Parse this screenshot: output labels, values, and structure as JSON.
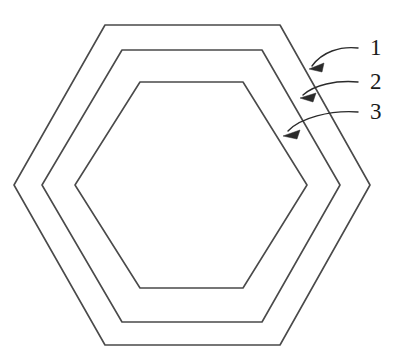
{
  "figure": {
    "background_color": "#ffffff",
    "line_color": "#4a4a4a",
    "leader_color": "#2b2b2b",
    "label_color": "#1a1a1a",
    "width": 407,
    "height": 363,
    "center": {
      "x": 192,
      "y": 185
    }
  },
  "shapes": [
    {
      "name": "outer-hexagon",
      "reference": "1",
      "points": "14,185 105,25 280,25 370,185 280,345 105,345",
      "top_y": 25,
      "bottom_y": 345,
      "left_x": 14,
      "right_x": 370
    },
    {
      "name": "middle-hexagon",
      "reference": "2",
      "points": "42,185 122,50 262,50 340,185 262,322 122,322",
      "top_y": 50,
      "bottom_y": 322,
      "left_x": 42,
      "right_x": 340
    },
    {
      "name": "inner-hexagon",
      "reference": "3",
      "points": "75,185 140,82 243,82 307,185 243,288 140,288",
      "top_y": 82,
      "bottom_y": 288,
      "left_x": 75,
      "right_x": 307
    }
  ],
  "callouts": [
    {
      "label": "1",
      "target_shape": "outer-hexagon",
      "label_x": 370,
      "label_y": 50,
      "leader_path": "M 358 48 C 340 46 322 52 312 66",
      "arrow_tip": {
        "x": 309,
        "y": 69
      },
      "arrow_points": "309,69 324,63 322,72"
    },
    {
      "label": "2",
      "target_shape": "middle-hexagon",
      "label_x": 370,
      "label_y": 84,
      "leader_path": "M 358 82 C 336 80 314 85 303 95",
      "arrow_tip": {
        "x": 300,
        "y": 98
      },
      "arrow_points": "300,98 316,93 313,102"
    },
    {
      "label": "3",
      "target_shape": "inner-hexagon",
      "label_x": 370,
      "label_y": 114,
      "leader_path": "M 358 112 C 330 110 300 118 288 131",
      "arrow_tip": {
        "x": 283,
        "y": 136
      },
      "arrow_points": "283,136 300,130 297,139"
    }
  ]
}
